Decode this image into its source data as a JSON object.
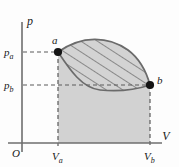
{
  "figure": {
    "type": "pv-thermodynamic-diagram",
    "axes": {
      "y_axis_label": "p",
      "x_axis_label": "V",
      "origin_label": "O"
    },
    "tick_labels": {
      "pressure_high": "p",
      "pressure_high_sub": "a",
      "pressure_low": "p",
      "pressure_low_sub": "b",
      "volume_low": "V",
      "volume_low_sub": "a",
      "volume_high": "V",
      "volume_high_sub": "b"
    },
    "points": [
      {
        "name": "a",
        "label": "a",
        "x": 58,
        "y": 52
      },
      {
        "name": "b",
        "label": "b",
        "x": 150,
        "y": 85
      }
    ],
    "colors": {
      "curve": "#6b6b6b",
      "fill_area": "#d2d2d2",
      "fill_lens": "#cfcfcf",
      "hatch": "#4a4a4a",
      "axis": "#6e6e6e",
      "dashed": "#5a5a5a",
      "marker": "#141414",
      "background": "#fdfdfd"
    },
    "geometry": {
      "origin_px": {
        "x": 22,
        "y": 143
      },
      "v_axis_end_px": {
        "x": 162,
        "y": 143
      },
      "p_axis_top_px": {
        "x": 22,
        "y": 22
      },
      "upper_curve_path": "M58,52 C82,35 108,36 128,50 C140,59 147,74 150,85",
      "lower_curve_path": "M58,52 C70,70 82,88 100,90 C120,92 138,89 150,85",
      "hatch_spacing_px": 9,
      "hatch_angle_deg": 60
    }
  }
}
